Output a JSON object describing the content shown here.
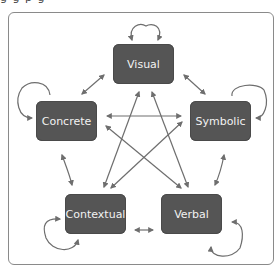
{
  "diagram": {
    "top_caption_cut": "g   g                                          p                   g",
    "nodes": [
      {
        "id": "visual",
        "label": "Visual"
      },
      {
        "id": "concrete",
        "label": "Concrete"
      },
      {
        "id": "symbolic",
        "label": "Symbolic"
      },
      {
        "id": "contextual",
        "label": "Contextual"
      },
      {
        "id": "verbal",
        "label": "Verbal"
      }
    ],
    "edges": [
      {
        "from": "visual",
        "to": "visual",
        "type": "self-loop"
      },
      {
        "from": "concrete",
        "to": "concrete",
        "type": "self-loop"
      },
      {
        "from": "symbolic",
        "to": "symbolic",
        "type": "self-loop"
      },
      {
        "from": "contextual",
        "to": "contextual",
        "type": "self-loop"
      },
      {
        "from": "verbal",
        "to": "verbal",
        "type": "self-loop"
      },
      {
        "from": "visual",
        "to": "concrete",
        "type": "bidirectional"
      },
      {
        "from": "visual",
        "to": "symbolic",
        "type": "bidirectional"
      },
      {
        "from": "concrete",
        "to": "contextual",
        "type": "bidirectional"
      },
      {
        "from": "symbolic",
        "to": "verbal",
        "type": "bidirectional"
      },
      {
        "from": "contextual",
        "to": "verbal",
        "type": "bidirectional"
      },
      {
        "from": "concrete",
        "to": "symbolic",
        "type": "bidirectional"
      },
      {
        "from": "visual",
        "to": "contextual",
        "type": "bidirectional"
      },
      {
        "from": "visual",
        "to": "verbal",
        "type": "bidirectional"
      },
      {
        "from": "concrete",
        "to": "verbal",
        "type": "bidirectional"
      },
      {
        "from": "symbolic",
        "to": "contextual",
        "type": "bidirectional"
      }
    ],
    "colors": {
      "node_fill": "#555555",
      "node_text": "#f2f2f2",
      "arrow": "#6e6e6e",
      "frame": "#8a8a8a"
    }
  }
}
